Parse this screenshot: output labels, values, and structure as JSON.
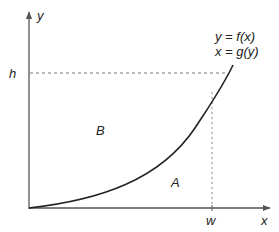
{
  "diagram": {
    "axes": {
      "x_label": "x",
      "y_label": "y"
    },
    "markers": {
      "h_label": "h",
      "w_label": "w"
    },
    "equations": {
      "line1": "y = f(x)",
      "line2": "x = g(y)"
    },
    "regions": {
      "upper_left": "B",
      "under_curve": "A"
    },
    "colors": {
      "axis": "#555555",
      "curve": "#222222",
      "dashed": "#777777",
      "text": "#222222"
    }
  }
}
